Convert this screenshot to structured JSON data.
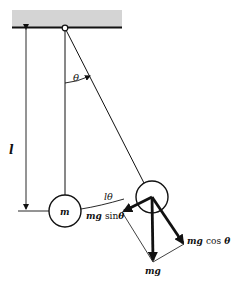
{
  "diagram": {
    "labels": {
      "angle": "θ",
      "length": "l",
      "mass": "m",
      "arc": "lθ",
      "tangential_force_prefix": "mg",
      "tangential_force_func": "sin",
      "tangential_force_var": "θ",
      "normal_force_prefix": "mg",
      "normal_force_func": "cos",
      "normal_force_var": "θ",
      "weight": "mg"
    },
    "colors": {
      "ceiling": "#d4d4d4",
      "line": "#111111",
      "background": "#ffffff"
    }
  }
}
